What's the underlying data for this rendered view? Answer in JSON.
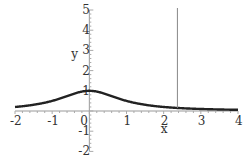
{
  "chart_data": {
    "type": "line",
    "title": "",
    "xlabel": "x",
    "ylabel": "y",
    "xlim": [
      -2,
      4
    ],
    "ylim": [
      -2,
      5
    ],
    "x_ticks": [
      "-2",
      "-1",
      "0",
      "1",
      "2",
      "3",
      "4"
    ],
    "y_ticks": [
      "-2",
      "-1",
      "1",
      "2",
      "3",
      "4",
      "5"
    ],
    "grid": false,
    "series": [
      {
        "name": "curve",
        "function": "1/(1+x^2)",
        "x": [
          -2,
          -1.5,
          -1,
          -0.5,
          0,
          0.5,
          1,
          1.5,
          2,
          2.5,
          3,
          3.5,
          4
        ],
        "y": [
          0.2,
          0.31,
          0.5,
          0.8,
          1.0,
          0.8,
          0.5,
          0.31,
          0.2,
          0.14,
          0.1,
          0.08,
          0.06
        ],
        "color": "#222222"
      }
    ],
    "annotations": [
      {
        "type": "vertical-line",
        "x": 2.37,
        "y_from": 0.15,
        "y_to": 5,
        "color": "#888888"
      }
    ]
  }
}
